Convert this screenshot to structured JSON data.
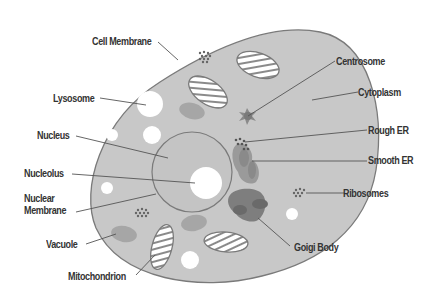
{
  "diagram": {
    "title": "",
    "type": "animal-cell",
    "colors": {
      "background": "#ffffff",
      "cytoplasm": "#c8c8c8",
      "outline": "#7a7a7a",
      "vacuole": "#a6a6a6",
      "golgi": "#7e7e7e",
      "er": "#9a9a9a",
      "white_spot": "#ffffff",
      "leader": "#555555",
      "text": "#333333"
    },
    "labels": {
      "cell_membrane": "Cell Membrane",
      "lysosome": "Lysosome",
      "nucleus": "Nucleus",
      "nucleolus": "Nucleolus",
      "nuclear_membrane_1": "Nuclear",
      "nuclear_membrane_2": "Membrane",
      "vacuole": "Vacuole",
      "mitochondrion": "Mitochondrion",
      "centrosome": "Centrosome",
      "cytoplasm": "Cytoplasm",
      "rough_er": "Rough ER",
      "smooth_er": "Smooth ER",
      "ribosomes": "Ribosomes",
      "golgi_body": "Goigi Body"
    }
  }
}
